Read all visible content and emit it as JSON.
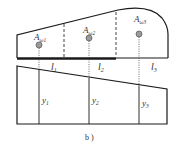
{
  "figure": {
    "caption": "b )",
    "top_section": {
      "areas": [
        {
          "label_main": "A",
          "label_sub": "ω1"
        },
        {
          "label_main": "A",
          "label_sub": "ω2"
        },
        {
          "label_main": "A",
          "label_sub": "ω3"
        }
      ],
      "segments": [
        {
          "label_main": "l",
          "label_sub": "1"
        },
        {
          "label_main": "l",
          "label_sub": "2"
        },
        {
          "label_main": "l",
          "label_sub": "3"
        }
      ]
    },
    "bottom_section": {
      "ordinates": [
        {
          "label_main": "y",
          "label_sub": "1"
        },
        {
          "label_main": "y",
          "label_sub": "2"
        },
        {
          "label_main": "y",
          "label_sub": "3"
        }
      ]
    },
    "colors": {
      "line": "#1a1a1a",
      "centroid_fill": "#9a9a9a",
      "centroid_stroke": "#555555"
    }
  }
}
